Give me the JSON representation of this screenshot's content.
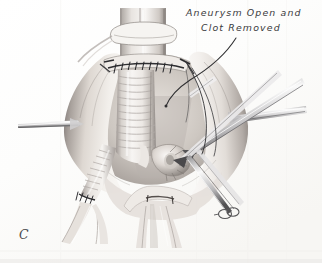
{
  "figure": {
    "panel_letter": "C",
    "callout": {
      "line_1": "Aneurysm Open and",
      "line_2": "Clot Removed"
    },
    "colors": {
      "paper": "#fdfdfc",
      "paper_edge": "#f0efec",
      "ink": "#3a3a3c",
      "panel_letter_ink": "#4a4a4c",
      "leader_line": "#2f2f31",
      "tissue_light": "#f4f1ee",
      "tissue_mid": "#cfc9c4",
      "tissue_shadow": "#8e8783",
      "tissue_deep_shadow": "#5d5754",
      "graft_light": "#f6f4f2",
      "graft_ridge": "#b4aeaa",
      "instrument_light": "#f7f7f6",
      "instrument_dark": "#4d4c4e",
      "suture": "#26262a"
    },
    "subject": {
      "title": "Abdominal aortic aneurysm repair",
      "stage": "Aneurysm sac opened, mural clot removed, crimped graft sutured to proximal aortic cuff"
    },
    "structures": [
      {
        "name": "proximal-aorta",
        "label": "Proximal aorta above clamp"
      },
      {
        "name": "umbilical-tape-band",
        "label": "Encircling tape / clamp band on proximal aorta"
      },
      {
        "name": "proximal-anastomosis-suture-line",
        "label": "Proximal anastomosis suture line"
      },
      {
        "name": "crimped-dacron-graft",
        "label": "Crimped Dacron tube graft"
      },
      {
        "name": "aneurysm-sac-left-wall",
        "label": "Opened aneurysm sac, left wall retracted"
      },
      {
        "name": "aneurysm-sac-right-wall",
        "label": "Opened aneurysm sac, right wall retracted"
      },
      {
        "name": "left-graft-limb",
        "label": "Left graft limb descending to iliac"
      },
      {
        "name": "distal-anastomosis-suture-line",
        "label": "Distal anastomosis suture line on left limb"
      },
      {
        "name": "right-limb-stump",
        "label": "Right limb / everted cuff held by forceps"
      },
      {
        "name": "aortic-bifurcation",
        "label": "Aortic bifurcation and iliac arteries"
      },
      {
        "name": "left-retractor-blade",
        "label": "Left retractor blade"
      },
      {
        "name": "right-retractor-blade",
        "label": "Right retractor blade"
      },
      {
        "name": "upper-right-instrument",
        "label": "Upper right instrument shaft"
      },
      {
        "name": "forceps-instrument",
        "label": "Forceps holding graft cuff"
      },
      {
        "name": "lower-right-clamp",
        "label": "Lower right vascular clamp with ringed handles"
      },
      {
        "name": "suture-needle-strands",
        "label": "Trailing suture strands in field"
      }
    ]
  }
}
